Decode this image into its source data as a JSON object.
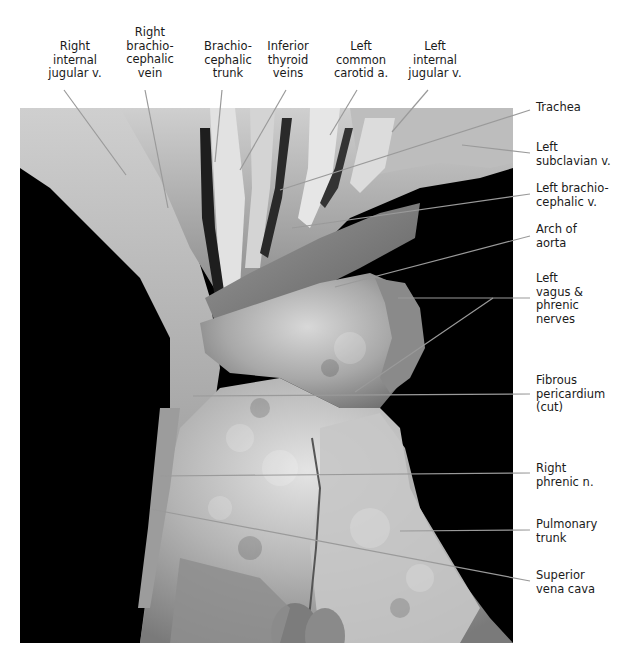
{
  "figure": {
    "top_labels": [
      {
        "id": "right-internal-jugular",
        "lines": [
          "Right",
          "internal",
          "jugular v."
        ]
      },
      {
        "id": "right-brachiocephalic-vein",
        "lines": [
          "Right",
          "brachio-",
          "cephalic",
          "vein"
        ]
      },
      {
        "id": "brachiocephalic-trunk",
        "lines": [
          "Brachio-",
          "cephalic",
          "trunk"
        ]
      },
      {
        "id": "inferior-thyroid-veins",
        "lines": [
          "Inferior",
          "thyroid",
          "veins"
        ]
      },
      {
        "id": "left-common-carotid",
        "lines": [
          "Left",
          "common",
          "carotid a."
        ]
      },
      {
        "id": "left-internal-jugular",
        "lines": [
          "Left",
          "internal",
          "jugular v."
        ]
      }
    ],
    "right_labels": [
      {
        "id": "trachea",
        "lines": [
          "Trachea"
        ]
      },
      {
        "id": "left-subclavian-v",
        "lines": [
          "Left",
          "subclavian v."
        ]
      },
      {
        "id": "left-brachiocephalic-v",
        "lines": [
          "Left brachio-",
          "cephalic v."
        ]
      },
      {
        "id": "arch-of-aorta",
        "lines": [
          "Arch of",
          "aorta"
        ]
      },
      {
        "id": "left-vagus-phrenic",
        "lines": [
          "Left",
          "vagus &",
          "phrenic",
          "nerves"
        ]
      },
      {
        "id": "fibrous-pericardium",
        "lines": [
          "Fibrous",
          "pericardium",
          "(cut)"
        ]
      },
      {
        "id": "right-phrenic-n",
        "lines": [
          "Right",
          "phrenic n."
        ]
      },
      {
        "id": "pulmonary-trunk",
        "lines": [
          "Pulmonary",
          "trunk"
        ]
      },
      {
        "id": "superior-vena-cava",
        "lines": [
          "Superior",
          "vena cava"
        ]
      }
    ],
    "colors": {
      "background": "#ffffff",
      "photo_backdrop": "#000000",
      "leader_line": "#9a9a9a",
      "label_text": "#1a1a1a"
    }
  }
}
